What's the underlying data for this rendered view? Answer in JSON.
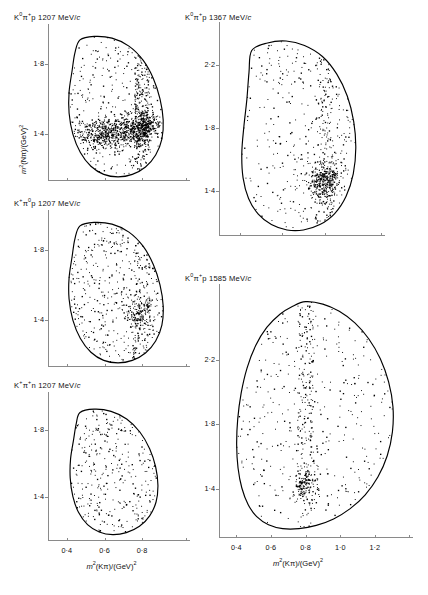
{
  "figure": {
    "kind": "dalitz-plot-array",
    "axis_label_x": "m²(Kπ)/(GeV)²",
    "axis_label_y": "m²(Nπ)/(GeV)²"
  },
  "chart_data": [
    {
      "id": "kzero-pi-p-1207",
      "type": "scatter",
      "title": "K⁰π⁺p 1207 MeV/c",
      "title_parts": {
        "k": "K",
        "k_sup": "0",
        "pi": "π",
        "pi_sup": "+",
        "rest": "p 1207 MeV/",
        "italic_c": "c"
      },
      "xlabel": "m²(Kπ)/(GeV)²",
      "ylabel": "m²(Nπ)/(GeV)²",
      "xlim": [
        0.3,
        0.98
      ],
      "ylim": [
        1.14,
        1.98
      ],
      "xticks": [
        0.4,
        0.6,
        0.8
      ],
      "xticklabels": [
        "0·4",
        "0·6",
        "0·8"
      ],
      "yticks": [
        1.4,
        1.8
      ],
      "yticklabels": [
        "1·4",
        "1·8"
      ],
      "grid": false,
      "n_points": 1450,
      "density": "high",
      "boundary": [
        [
          0.47,
          1.935
        ],
        [
          0.545,
          1.955
        ],
        [
          0.64,
          1.945
        ],
        [
          0.73,
          1.9
        ],
        [
          0.805,
          1.82
        ],
        [
          0.86,
          1.715
        ],
        [
          0.895,
          1.6
        ],
        [
          0.912,
          1.48
        ],
        [
          0.905,
          1.372
        ],
        [
          0.872,
          1.282
        ],
        [
          0.818,
          1.214
        ],
        [
          0.748,
          1.172
        ],
        [
          0.672,
          1.158
        ],
        [
          0.596,
          1.172
        ],
        [
          0.528,
          1.218
        ],
        [
          0.472,
          1.296
        ],
        [
          0.432,
          1.4
        ],
        [
          0.412,
          1.52
        ],
        [
          0.412,
          1.64
        ],
        [
          0.428,
          1.76
        ],
        [
          0.443,
          1.862
        ]
      ],
      "clusters": [
        {
          "cx": 0.805,
          "cy": 1.445,
          "rx": 0.055,
          "ry": 0.075,
          "weight": 0.2,
          "note": "K*(890) band crossing"
        },
        {
          "cx": 0.7,
          "cy": 1.42,
          "rx": 0.115,
          "ry": 0.085,
          "weight": 0.16
        },
        {
          "cx": 0.58,
          "cy": 1.39,
          "rx": 0.09,
          "ry": 0.07,
          "weight": 0.1
        }
      ],
      "bands": [
        {
          "orientation": "vertical",
          "center": 0.8,
          "halfwidth": 0.04,
          "weight": 0.14
        },
        {
          "orientation": "horizontal",
          "center": 1.42,
          "halfwidth": 0.06,
          "weight": 0.12
        }
      ]
    },
    {
      "id": "kplus-pizero-p-1207",
      "type": "scatter",
      "title": "K⁺ π⁰p 1207 MeV/c",
      "title_parts": {
        "k": "K",
        "k_sup": "+",
        "pi": "π",
        "pi_sup": "0",
        "rest": "p 1207 MeV/",
        "italic_c": "c"
      },
      "xlabel": "m²(Kπ)/(GeV)²",
      "ylabel": "m²(Nπ)/(GeV)²",
      "xlim": [
        0.3,
        0.98
      ],
      "ylim": [
        1.14,
        1.98
      ],
      "xticks": [
        0.4,
        0.6,
        0.8
      ],
      "xticklabels": [
        "0·4",
        "0·6",
        "0·8"
      ],
      "yticks": [
        1.4,
        1.8
      ],
      "yticklabels": [
        "1·4",
        "1·8"
      ],
      "grid": false,
      "n_points": 640,
      "density": "medium",
      "boundary": [
        [
          0.47,
          1.935
        ],
        [
          0.545,
          1.955
        ],
        [
          0.64,
          1.945
        ],
        [
          0.73,
          1.9
        ],
        [
          0.805,
          1.82
        ],
        [
          0.86,
          1.715
        ],
        [
          0.895,
          1.6
        ],
        [
          0.912,
          1.48
        ],
        [
          0.905,
          1.372
        ],
        [
          0.872,
          1.282
        ],
        [
          0.818,
          1.214
        ],
        [
          0.748,
          1.172
        ],
        [
          0.672,
          1.158
        ],
        [
          0.596,
          1.172
        ],
        [
          0.528,
          1.218
        ],
        [
          0.472,
          1.296
        ],
        [
          0.432,
          1.4
        ],
        [
          0.412,
          1.52
        ],
        [
          0.412,
          1.64
        ],
        [
          0.428,
          1.76
        ],
        [
          0.443,
          1.862
        ]
      ],
      "clusters": [
        {
          "cx": 0.79,
          "cy": 1.44,
          "rx": 0.06,
          "ry": 0.08,
          "weight": 0.17
        }
      ],
      "bands": [
        {
          "orientation": "vertical",
          "center": 0.795,
          "halfwidth": 0.045,
          "weight": 0.12
        }
      ]
    },
    {
      "id": "kplus-pi-n-1207",
      "type": "scatter",
      "title": "K⁺π⁺n 1207 MeV/c",
      "title_parts": {
        "k": "K",
        "k_sup": "+",
        "pi": "π",
        "pi_sup": "+",
        "rest": "n 1207 MeV/",
        "italic_c": "c"
      },
      "xlabel": "m²(Kπ)/(GeV)²",
      "ylabel": "m²(Nπ)/(GeV)²",
      "xlim": [
        0.3,
        0.98
      ],
      "ylim": [
        1.14,
        1.98
      ],
      "xticks": [
        0.4,
        0.6,
        0.8
      ],
      "xticklabels": [
        "0·4",
        "0·6",
        "0·8"
      ],
      "yticks": [
        1.4,
        1.8
      ],
      "yticklabels": [
        "1·4",
        "1·8"
      ],
      "grid": false,
      "n_points": 330,
      "density": "low",
      "boundary": [
        [
          0.47,
          1.905
        ],
        [
          0.545,
          1.925
        ],
        [
          0.635,
          1.912
        ],
        [
          0.718,
          1.866
        ],
        [
          0.788,
          1.788
        ],
        [
          0.84,
          1.688
        ],
        [
          0.872,
          1.578
        ],
        [
          0.884,
          1.468
        ],
        [
          0.874,
          1.368
        ],
        [
          0.84,
          1.285
        ],
        [
          0.786,
          1.222
        ],
        [
          0.716,
          1.184
        ],
        [
          0.644,
          1.172
        ],
        [
          0.572,
          1.188
        ],
        [
          0.51,
          1.232
        ],
        [
          0.462,
          1.306
        ],
        [
          0.432,
          1.402
        ],
        [
          0.418,
          1.512
        ],
        [
          0.42,
          1.628
        ],
        [
          0.436,
          1.742
        ],
        [
          0.45,
          1.838
        ]
      ],
      "clusters": [],
      "bands": []
    },
    {
      "id": "kzero-pi-p-1367",
      "type": "scatter",
      "title": "K⁰ π⁺ p 1367 MeV/c",
      "title_parts": {
        "k": "K",
        "k_sup": "0",
        "pi": "π",
        "pi_sup": "+",
        "rest": "p 1367 MeV/",
        "italic_c": "c"
      },
      "xlabel": "m²(Kπ)/(GeV)²",
      "ylabel": "m²(Nπ)/(GeV)²",
      "xlim": [
        0.3,
        1.02
      ],
      "ylim": [
        1.12,
        2.42
      ],
      "xticks": [
        0.4,
        0.6,
        0.8
      ],
      "xticklabels": [
        "0·4",
        "0·6",
        "0·8"
      ],
      "yticks": [
        1.4,
        1.8,
        2.2
      ],
      "yticklabels": [
        "1·4",
        "1·8",
        "2·2"
      ],
      "grid": false,
      "n_points": 800,
      "density": "medium-high",
      "boundary": [
        [
          0.455,
          2.29
        ],
        [
          0.53,
          2.338
        ],
        [
          0.618,
          2.35
        ],
        [
          0.705,
          2.322
        ],
        [
          0.79,
          2.252
        ],
        [
          0.858,
          2.14
        ],
        [
          0.908,
          2.0
        ],
        [
          0.938,
          1.84
        ],
        [
          0.948,
          1.672
        ],
        [
          0.936,
          1.508
        ],
        [
          0.902,
          1.366
        ],
        [
          0.848,
          1.256
        ],
        [
          0.778,
          1.186
        ],
        [
          0.7,
          1.152
        ],
        [
          0.622,
          1.152
        ],
        [
          0.548,
          1.186
        ],
        [
          0.486,
          1.252
        ],
        [
          0.44,
          1.352
        ],
        [
          0.414,
          1.482
        ],
        [
          0.408,
          1.64
        ],
        [
          0.418,
          1.81
        ],
        [
          0.432,
          1.98
        ],
        [
          0.442,
          2.15
        ]
      ],
      "clusters": [
        {
          "cx": 0.815,
          "cy": 1.49,
          "rx": 0.06,
          "ry": 0.095,
          "weight": 0.18
        },
        {
          "cx": 0.79,
          "cy": 1.42,
          "rx": 0.07,
          "ry": 0.08,
          "weight": 0.13
        }
      ],
      "bands": [
        {
          "orientation": "vertical",
          "center": 0.8,
          "halfwidth": 0.042,
          "weight": 0.14
        }
      ]
    },
    {
      "id": "kzero-pi-p-1585",
      "type": "scatter",
      "title": "K⁰ π⁺ p 1585 MeV/c",
      "title_parts": {
        "k": "K",
        "k_sup": "0",
        "pi": "π",
        "pi_sup": "+",
        "rest": "p 1585 MeV/",
        "italic_c": "c"
      },
      "xlabel": "m²(Kπ)/(GeV)²",
      "ylabel": "m²(Nπ)/(GeV)²",
      "xlim": [
        0.3,
        1.34
      ],
      "ylim": [
        1.1,
        2.62
      ],
      "xticks": [
        0.4,
        0.6,
        0.8,
        1.0,
        1.2
      ],
      "xticklabels": [
        "0·4",
        "0·6",
        "0·8",
        "1·0",
        "1·2"
      ],
      "yticks": [
        1.4,
        1.8,
        2.2
      ],
      "yticklabels": [
        "1·4",
        "1·8",
        "2·2"
      ],
      "grid": false,
      "n_points": 700,
      "density": "medium",
      "boundary": [
        [
          0.8,
          2.56
        ],
        [
          0.9,
          2.545
        ],
        [
          0.995,
          2.5
        ],
        [
          1.085,
          2.428
        ],
        [
          1.165,
          2.33
        ],
        [
          1.232,
          2.206
        ],
        [
          1.28,
          2.062
        ],
        [
          1.305,
          1.908
        ],
        [
          1.302,
          1.752
        ],
        [
          1.272,
          1.604
        ],
        [
          1.218,
          1.472
        ],
        [
          1.145,
          1.362
        ],
        [
          1.058,
          1.276
        ],
        [
          0.962,
          1.212
        ],
        [
          0.862,
          1.172
        ],
        [
          0.762,
          1.152
        ],
        [
          0.668,
          1.152
        ],
        [
          0.586,
          1.176
        ],
        [
          0.518,
          1.226
        ],
        [
          0.468,
          1.302
        ],
        [
          0.432,
          1.404
        ],
        [
          0.41,
          1.528
        ],
        [
          0.402,
          1.672
        ],
        [
          0.408,
          1.83
        ],
        [
          0.428,
          1.992
        ],
        [
          0.462,
          2.148
        ],
        [
          0.512,
          2.288
        ],
        [
          0.576,
          2.4
        ],
        [
          0.652,
          2.482
        ],
        [
          0.726,
          2.532
        ]
      ],
      "clusters": [
        {
          "cx": 0.8,
          "cy": 1.43,
          "rx": 0.065,
          "ry": 0.09,
          "weight": 0.14
        }
      ],
      "bands": [
        {
          "orientation": "vertical",
          "center": 0.8,
          "halfwidth": 0.045,
          "weight": 0.22
        }
      ]
    }
  ],
  "layout": {
    "panels": [
      {
        "ref": "kzero-pi-p-1207",
        "x": 48,
        "y": 32,
        "w": 128,
        "h": 148,
        "title_x": 14,
        "title_y": 11,
        "show_ylabel": true,
        "show_xlabel": false,
        "show_xticklabels": false
      },
      {
        "ref": "kplus-pizero-p-1207",
        "x": 48,
        "y": 218,
        "w": 128,
        "h": 148,
        "title_x": 14,
        "title_y": 197,
        "show_ylabel": false,
        "show_xlabel": false,
        "show_xticklabels": false
      },
      {
        "ref": "kplus-pi-n-1207",
        "x": 48,
        "y": 400,
        "w": 128,
        "h": 140,
        "title_x": 14,
        "title_y": 379,
        "show_ylabel": false,
        "show_xlabel": true,
        "show_xticklabels": true
      },
      {
        "ref": "kzero-pi-p-1367",
        "x": 219,
        "y": 30,
        "w": 152,
        "h": 205,
        "title_x": 185,
        "title_y": 11,
        "show_ylabel": false,
        "show_xlabel": false,
        "show_xticklabels": false
      },
      {
        "ref": "kzero-pi-p-1585",
        "x": 219,
        "y": 292,
        "w": 180,
        "h": 245,
        "title_x": 185,
        "title_y": 272,
        "show_ylabel": false,
        "show_xlabel": true,
        "show_xticklabels": true
      }
    ]
  }
}
